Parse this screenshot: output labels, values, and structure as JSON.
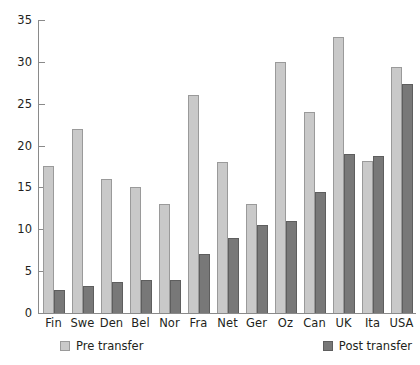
{
  "chart_data": {
    "type": "bar",
    "title": "",
    "subtitle": "",
    "xlabel": "",
    "ylabel": "",
    "categories": [
      "Fin",
      "Swe",
      "Den",
      "Bel",
      "Nor",
      "Fra",
      "Net",
      "Ger",
      "Oz",
      "Can",
      "UK",
      "Ita",
      "USA"
    ],
    "series": [
      {
        "name": "Pre transfer",
        "color": "#c9c9c9",
        "values": [
          17.6,
          22.0,
          16.0,
          15.0,
          13.0,
          26.0,
          18.0,
          13.0,
          30.0,
          24.0,
          33.0,
          18.2,
          29.4
        ]
      },
      {
        "name": "Post transfer",
        "color": "#787878",
        "values": [
          2.7,
          3.2,
          3.7,
          4.0,
          4.0,
          7.0,
          9.0,
          10.5,
          11.0,
          14.5,
          19.0,
          18.8,
          27.3
        ]
      }
    ],
    "ylim": [
      0,
      35
    ],
    "yticks": [
      0,
      5,
      10,
      15,
      20,
      25,
      30,
      35
    ],
    "ytick_labels": [
      "0",
      "5",
      "10",
      "15",
      "20",
      "25",
      "30",
      "35"
    ],
    "grid": false,
    "legend_position": "bottom",
    "legend": [
      "Pre transfer",
      "Post transfer"
    ]
  },
  "legend": {
    "pre_label": "Pre transfer",
    "post_label": "Post transfer"
  },
  "axis": {
    "axis_color": "#8a8a8a"
  }
}
